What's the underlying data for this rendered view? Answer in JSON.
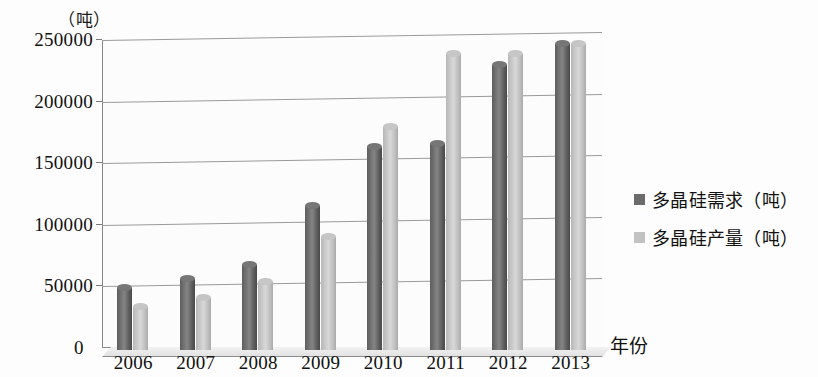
{
  "chart_data": {
    "type": "bar",
    "title": "",
    "unit_caption": "（吨）",
    "xlabel": "年份",
    "ylabel": "",
    "categories": [
      "2006",
      "2007",
      "2008",
      "2009",
      "2010",
      "2011",
      "2012",
      "2013"
    ],
    "series": [
      {
        "name": "多晶硅需求（吨）",
        "color": "#6b6b6b",
        "values": [
          50000,
          58000,
          69000,
          117000,
          165000,
          167000,
          231000,
          248000
        ]
      },
      {
        "name": "多晶硅产量（吨）",
        "color": "#c2c2c2",
        "values": [
          35000,
          42000,
          55000,
          92000,
          181000,
          240000,
          240000,
          248000
        ]
      }
    ],
    "ylim": [
      0,
      250000
    ],
    "ytick_labels": [
      "250000",
      "200000",
      "150000",
      "100000",
      "50000",
      "0"
    ],
    "ytick_values": [
      250000,
      200000,
      150000,
      100000,
      50000,
      0
    ],
    "grid": true,
    "legend_position": "right"
  },
  "legend": {
    "items": [
      {
        "label": "多晶硅需求（吨）"
      },
      {
        "label": "多晶硅产量（吨）"
      }
    ]
  },
  "axis": {
    "zero_label": "0",
    "x_title": "年份",
    "unit": "（吨）"
  }
}
